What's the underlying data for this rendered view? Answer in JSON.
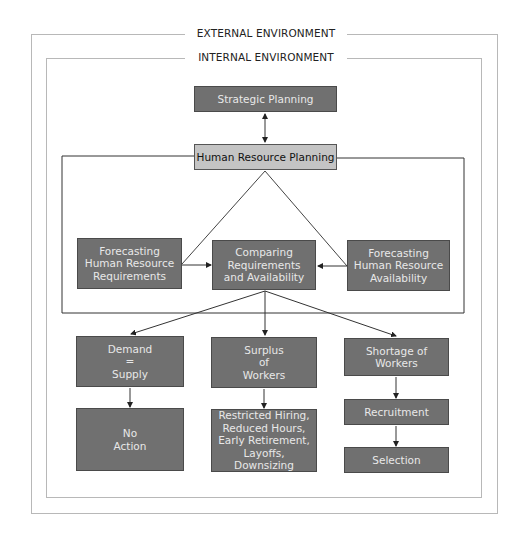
{
  "diagram": {
    "frames": {
      "external": "EXTERNAL ENVIRONMENT",
      "internal": "INTERNAL ENVIRONMENT"
    },
    "nodes": {
      "strategic": "Strategic Planning",
      "hrp": "Human Resource Planning",
      "forecast_req": "Forecasting\nHuman Resource\nRequirements",
      "comparing": "Comparing\nRequirements\nand Availability",
      "forecast_avail": "Forecasting\nHuman Resource\nAvailability",
      "demand": "Demand\n=\nSupply",
      "surplus": "Surplus\nof\nWorkers",
      "shortage": "Shortage of\nWorkers",
      "no_action": "No\nAction",
      "surplus_actions": "Restricted Hiring,\nReduced Hours,\nEarly Retirement,\nLayoffs, Downsizing",
      "recruitment": "Recruitment",
      "selection": "Selection"
    },
    "colors": {
      "dark_box": "#707070",
      "light_box": "#c4c4c4",
      "frame": "#b8b8b8",
      "line": "#333333"
    }
  }
}
